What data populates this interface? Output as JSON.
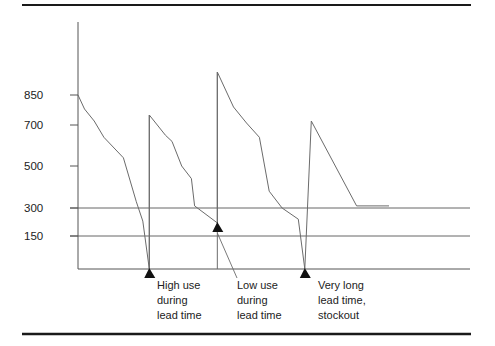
{
  "chart_data": {
    "type": "line",
    "title": "",
    "xlabel": "",
    "ylabel": "",
    "y_ticks": [
      850,
      700,
      500,
      300,
      150
    ],
    "ylim": [
      0,
      1000
    ],
    "grid": false,
    "reference_lines": [
      {
        "name": "reorder-point",
        "value": 300
      },
      {
        "name": "safety-stock",
        "value": 150
      }
    ],
    "series": [
      {
        "name": "inventory-level",
        "points": [
          [
            0,
            850
          ],
          [
            4,
            780
          ],
          [
            10,
            720
          ],
          [
            16,
            640
          ],
          [
            28,
            540
          ],
          [
            36,
            330
          ],
          [
            40,
            230
          ],
          [
            44,
            0
          ],
          [
            44,
            750
          ],
          [
            54,
            650
          ],
          [
            58,
            620
          ],
          [
            64,
            500
          ],
          [
            70,
            440
          ],
          [
            72,
            310
          ],
          [
            86,
            220
          ],
          [
            86,
            965
          ],
          [
            96,
            790
          ],
          [
            104,
            710
          ],
          [
            112,
            640
          ],
          [
            118,
            380
          ],
          [
            126,
            300
          ],
          [
            136,
            240
          ],
          [
            140,
            0
          ],
          [
            144,
            720
          ],
          [
            172,
            310
          ],
          [
            192,
            310
          ]
        ]
      }
    ],
    "annotations": [
      {
        "label_lines": [
          "High use",
          "during",
          "lead time"
        ],
        "point": [
          44,
          0
        ]
      },
      {
        "label_lines": [
          "Low use",
          "during",
          "lead time"
        ],
        "point": [
          86,
          220
        ]
      },
      {
        "label_lines": [
          "Very long",
          "lead time,",
          "stockout"
        ],
        "point": [
          140,
          0
        ]
      }
    ]
  },
  "axis": {
    "tick_labels": [
      "850",
      "700",
      "500",
      "300",
      "150"
    ]
  },
  "annotations_text": {
    "high_use": [
      "High use",
      "during",
      "lead time"
    ],
    "low_use": [
      "Low use",
      "during",
      "lead time"
    ],
    "stockout": [
      "Very long",
      "lead time,",
      "stockout"
    ]
  },
  "colors": {
    "line": "#6b6b6b",
    "axis": "#555555",
    "rule": "#1a1a1a",
    "text": "#222222",
    "arrow": "#111111"
  }
}
